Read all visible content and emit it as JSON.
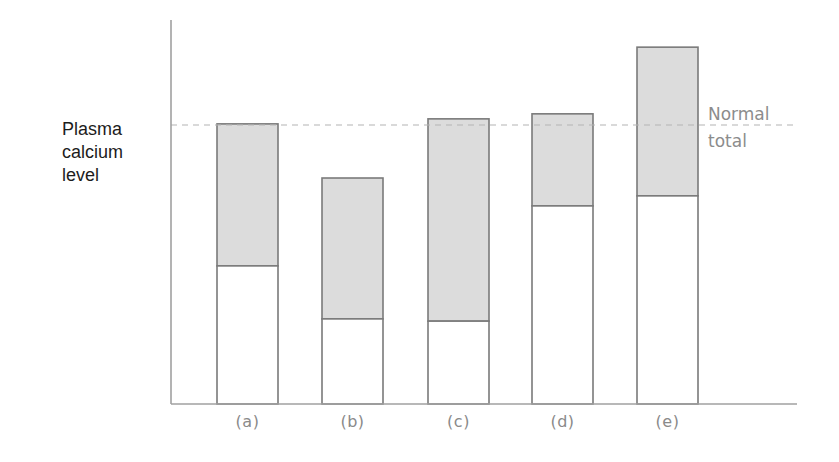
{
  "chart_data": {
    "type": "bar",
    "stacked": true,
    "title": "",
    "xlabel": "",
    "ylabel": "Plasma\ncalcium\nlevel",
    "categories": [
      "(a)",
      "(b)",
      "(c)",
      "(d)",
      "(e)"
    ],
    "series": [
      {
        "name": "lower segment (white)",
        "color": "#ffffff",
        "values": [
          49.5,
          30.5,
          29.7,
          71.0,
          74.6
        ]
      },
      {
        "name": "upper segment (grey)",
        "color": "#dcdcdc",
        "values": [
          50.9,
          50.5,
          72.5,
          33.0,
          53.3
        ]
      }
    ],
    "totals": [
      100.4,
      81.0,
      102.2,
      104.0,
      127.9
    ],
    "reference_line": {
      "label": "Normal\ntotal",
      "value": 100,
      "style": "dashed",
      "color": "#b4b4b4"
    },
    "ylim": [
      0,
      138
    ],
    "y_ticks_shown": false,
    "grid": false,
    "legend": "none",
    "units_note": "relative scale; normal total = 100"
  },
  "style": {
    "bar_outline": "#7a7a7a",
    "axis_color": "#a0a0a0",
    "grey_fill": "#dcdcdc",
    "tick_label_color": "#8a8a8a"
  }
}
